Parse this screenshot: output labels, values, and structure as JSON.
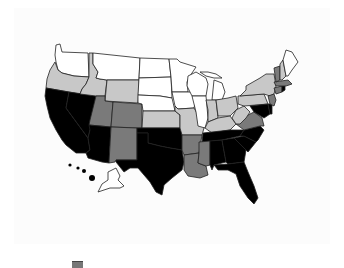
{
  "map": {
    "title": "",
    "type": "choropleth",
    "region": "United States",
    "fill_scale": {
      "white": "#ffffff",
      "light": "#c8c8c8",
      "medium": "#7a7a7a",
      "dark": "#000000"
    },
    "states": {
      "WA": "white",
      "OR": "light",
      "CA": "dark",
      "NV": "dark",
      "ID": "light",
      "MT": "white",
      "WY": "light",
      "UT": "medium",
      "AZ": "dark",
      "CO": "medium",
      "NM": "medium",
      "ND": "white",
      "SD": "white",
      "NE": "white",
      "KS": "light",
      "OK": "dark",
      "TX": "dark",
      "MN": "white",
      "IA": "white",
      "MO": "light",
      "AR": "medium",
      "LA": "medium",
      "WI": "white",
      "IL": "white",
      "MI": "white",
      "IN": "light",
      "OH": "light",
      "KY": "light",
      "TN": "dark",
      "MS": "medium",
      "AL": "dark",
      "GA": "dark",
      "FL": "dark",
      "SC": "dark",
      "NC": "dark",
      "VA": "medium",
      "WV": "light",
      "PA": "light",
      "NY": "light",
      "MD": "dark",
      "DE": "dark",
      "NJ": "medium",
      "CT": "medium",
      "RI": "dark",
      "MA": "medium",
      "VT": "medium",
      "NH": "light",
      "ME": "white",
      "AK": "white",
      "HI": "dark"
    }
  },
  "legend": {
    "items": [
      {
        "label": ""
      }
    ]
  }
}
